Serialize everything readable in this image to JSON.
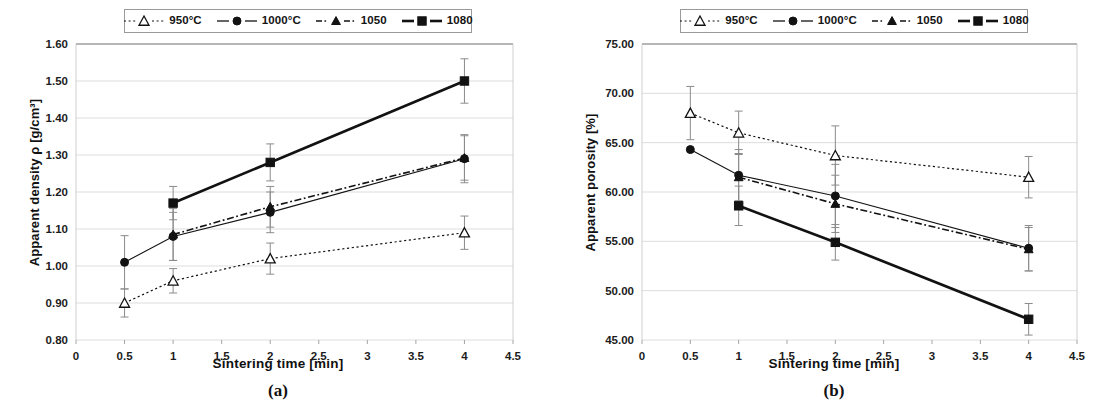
{
  "figure": {
    "panels": [
      {
        "caption": "(a)",
        "xlabel": "Sintering time [min]",
        "ylabel": "Apparent density ρ [g/cm³]",
        "xticks": [
          "0",
          "0.5",
          "1",
          "1.5",
          "2",
          "2.5",
          "3",
          "3.5",
          "4",
          "4.5"
        ],
        "yticks": [
          "0.80",
          "0.90",
          "1.00",
          "1.10",
          "1.20",
          "1.30",
          "1.40",
          "1.50",
          "1.60"
        ]
      },
      {
        "caption": "(b)",
        "xlabel": "Sintering time [min]",
        "ylabel": "Apparent porosity [%]",
        "xticks": [
          "0",
          "0.5",
          "1",
          "1.5",
          "2",
          "2.5",
          "3",
          "3.5",
          "4",
          "4.5"
        ],
        "yticks": [
          "45.00",
          "50.00",
          "55.00",
          "60.00",
          "65.00",
          "70.00",
          "75.00"
        ]
      }
    ],
    "legend": [
      {
        "label": "950°C",
        "marker": "open-triangle",
        "line": "dotted"
      },
      {
        "label": "1000°C",
        "marker": "filled-circle",
        "line": "solid"
      },
      {
        "label": "1050",
        "marker": "filled-triangle",
        "line": "dash-dot"
      },
      {
        "label": "1080",
        "marker": "filled-square",
        "line": "solid-thick"
      }
    ]
  },
  "chart_data": [
    {
      "type": "line",
      "title": "(a) Apparent density vs sintering time",
      "xlabel": "Sintering time [min]",
      "ylabel": "Apparent density ρ [g/cm³]",
      "xlim": [
        0,
        4.5
      ],
      "ylim": [
        0.8,
        1.6
      ],
      "xticks": [
        0,
        0.5,
        1,
        1.5,
        2,
        2.5,
        3,
        3.5,
        4,
        4.5
      ],
      "yticks": [
        0.8,
        0.9,
        1.0,
        1.1,
        1.2,
        1.3,
        1.4,
        1.5,
        1.6
      ],
      "grid": "horizontal",
      "legend_position": "top-center",
      "x": [
        0.5,
        1,
        2,
        4
      ],
      "series": [
        {
          "name": "950°C",
          "style": "dotted",
          "marker": "open-triangle",
          "x": [
            0.5,
            1,
            2,
            4
          ],
          "values": [
            0.9,
            0.96,
            1.02,
            1.09
          ],
          "errors": [
            0.038,
            0.033,
            0.042,
            0.045
          ]
        },
        {
          "name": "1000°C",
          "style": "solid",
          "marker": "filled-circle",
          "x": [
            0.5,
            1,
            2,
            4
          ],
          "values": [
            1.01,
            1.08,
            1.145,
            1.29
          ],
          "errors": [
            0.072,
            0.065,
            0.055,
            0.065
          ]
        },
        {
          "name": "1050",
          "style": "dash-dot",
          "marker": "filled-triangle",
          "x": [
            1,
            2,
            4
          ],
          "values": [
            1.085,
            1.16,
            1.292
          ],
          "errors": [
            0.07,
            0.055,
            0.06
          ]
        },
        {
          "name": "1080",
          "style": "solid-thick",
          "marker": "filled-square",
          "x": [
            1,
            2,
            4
          ],
          "values": [
            1.17,
            1.28,
            1.5
          ],
          "errors": [
            0.045,
            0.05,
            0.06
          ]
        }
      ]
    },
    {
      "type": "line",
      "title": "(b) Apparent porosity vs sintering time",
      "xlabel": "Sintering time [min]",
      "ylabel": "Apparent porosity [%]",
      "xlim": [
        0,
        4.5
      ],
      "ylim": [
        45,
        75
      ],
      "xticks": [
        0,
        0.5,
        1,
        1.5,
        2,
        2.5,
        3,
        3.5,
        4,
        4.5
      ],
      "yticks": [
        45,
        50,
        55,
        60,
        65,
        70,
        75
      ],
      "grid": "horizontal",
      "legend_position": "top-center",
      "x": [
        0.5,
        1,
        2,
        4
      ],
      "series": [
        {
          "name": "950°C",
          "style": "dotted",
          "marker": "open-triangle",
          "x": [
            0.5,
            1,
            2,
            4
          ],
          "values": [
            68.0,
            66.0,
            63.7,
            61.5
          ],
          "errors": [
            2.7,
            2.2,
            3.0,
            2.1
          ]
        },
        {
          "name": "1000°C",
          "style": "solid",
          "marker": "filled-circle",
          "x": [
            0.5,
            1,
            2,
            4
          ],
          "values": [
            64.3,
            61.7,
            59.6,
            54.3
          ],
          "errors": [
            0.0,
            2.6,
            3.2,
            2.3
          ]
        },
        {
          "name": "1050",
          "style": "dash-dot",
          "marker": "filled-triangle",
          "x": [
            1,
            2,
            4
          ],
          "values": [
            61.5,
            58.8,
            54.2
          ],
          "errors": [
            2.4,
            2.9,
            2.2
          ]
        },
        {
          "name": "1080",
          "style": "solid-thick",
          "marker": "filled-square",
          "x": [
            1,
            2,
            4
          ],
          "values": [
            58.6,
            54.9,
            47.1
          ],
          "errors": [
            2.0,
            1.8,
            1.6
          ]
        }
      ]
    }
  ]
}
